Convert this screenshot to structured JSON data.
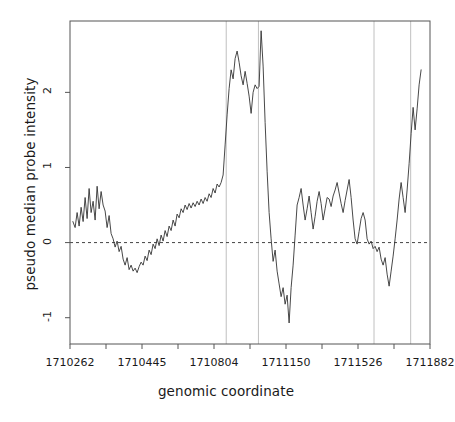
{
  "chart_data": {
    "type": "line",
    "title": "",
    "xlabel": "genomic coordinate",
    "ylabel": "pseudo median probe intensity",
    "grid": false,
    "legend": null,
    "xlim": [
      1710262,
      1711882
    ],
    "ylim": [
      -1.35,
      2.95
    ],
    "xticks": [
      1710262,
      1710445,
      1710804,
      1711150,
      1711526,
      1711882
    ],
    "xtick_labels": [
      "1710262",
      "1710445",
      "1710804",
      "1711150",
      "1711526",
      "1711882"
    ],
    "yticks": [
      -1,
      0,
      1,
      2
    ],
    "ytick_labels": [
      "-1",
      "0",
      "1",
      "2"
    ],
    "zero_line": 0,
    "zero_line_style": "dashed",
    "vertical_markers": [
      1710965,
      1711110,
      1711630,
      1711795
    ],
    "series": [
      {
        "name": "pseudo median probe intensity",
        "color": "#333333",
        "x": [
          1710275,
          1710285,
          1710294,
          1710303,
          1710312,
          1710321,
          1710330,
          1710339,
          1710348,
          1710357,
          1710366,
          1710375,
          1710384,
          1710393,
          1710402,
          1710411,
          1710420,
          1710429,
          1710438,
          1710447,
          1710456,
          1710465,
          1710474,
          1710483,
          1710492,
          1710501,
          1710510,
          1710519,
          1710528,
          1710537,
          1710546,
          1710555,
          1710564,
          1710573,
          1710582,
          1710591,
          1710600,
          1710609,
          1710618,
          1710627,
          1710636,
          1710645,
          1710654,
          1710663,
          1710672,
          1710681,
          1710690,
          1710699,
          1710708,
          1710717,
          1710726,
          1710735,
          1710744,
          1710753,
          1710762,
          1710771,
          1710780,
          1710789,
          1710798,
          1710807,
          1710816,
          1710825,
          1710834,
          1710843,
          1710852,
          1710861,
          1710870,
          1710879,
          1710888,
          1710897,
          1710906,
          1710915,
          1710924,
          1710933,
          1710942,
          1710951,
          1710960,
          1710969,
          1710978,
          1710987,
          1710996,
          1711005,
          1711014,
          1711023,
          1711032,
          1711041,
          1711050,
          1711059,
          1711068,
          1711077,
          1711086,
          1711095,
          1711104,
          1711113,
          1711122,
          1711131,
          1711140,
          1711149,
          1711158,
          1711167,
          1711176,
          1711185,
          1711194,
          1711203,
          1711212,
          1711221,
          1711230,
          1711239,
          1711248,
          1711257,
          1711266,
          1711275,
          1711284,
          1711293,
          1711302,
          1711311,
          1711320,
          1711329,
          1711338,
          1711347,
          1711356,
          1711365,
          1711374,
          1711383,
          1711392,
          1711401,
          1711410,
          1711419,
          1711428,
          1711437,
          1711446,
          1711455,
          1711464,
          1711473,
          1711482,
          1711491,
          1711500,
          1711509,
          1711518,
          1711527,
          1711536,
          1711545,
          1711554,
          1711563,
          1711572,
          1711581,
          1711590,
          1711599,
          1711608,
          1711617,
          1711626,
          1711635,
          1711644,
          1711653,
          1711662,
          1711671,
          1711680,
          1711689,
          1711698,
          1711707,
          1711716,
          1711725,
          1711734,
          1711743,
          1711752,
          1711761,
          1711770,
          1711779,
          1711788,
          1711797,
          1711806,
          1711815,
          1711824,
          1711833,
          1711842
        ],
        "y": [
          0.28,
          0.2,
          0.4,
          0.22,
          0.47,
          0.28,
          0.6,
          0.32,
          0.72,
          0.4,
          0.55,
          0.3,
          0.75,
          0.45,
          0.68,
          0.5,
          0.42,
          0.2,
          0.36,
          0.12,
          0.05,
          -0.06,
          0.02,
          -0.12,
          -0.05,
          -0.22,
          -0.3,
          -0.2,
          -0.36,
          -0.3,
          -0.38,
          -0.34,
          -0.4,
          -0.32,
          -0.26,
          -0.3,
          -0.18,
          -0.24,
          -0.1,
          -0.16,
          -0.02,
          -0.08,
          0.05,
          -0.04,
          0.1,
          0.02,
          0.16,
          0.08,
          0.22,
          0.16,
          0.3,
          0.22,
          0.38,
          0.33,
          0.45,
          0.4,
          0.5,
          0.44,
          0.52,
          0.46,
          0.53,
          0.48,
          0.55,
          0.5,
          0.58,
          0.52,
          0.6,
          0.55,
          0.65,
          0.6,
          0.72,
          0.66,
          0.78,
          0.74,
          0.8,
          0.9,
          1.3,
          1.7,
          2.05,
          2.3,
          2.18,
          2.45,
          2.55,
          2.4,
          2.22,
          2.1,
          2.28,
          2.12,
          1.95,
          1.72,
          2.0,
          2.1,
          2.05,
          2.08,
          2.82,
          2.35,
          1.6,
          0.95,
          0.4,
          0.05,
          -0.25,
          -0.1,
          -0.38,
          -0.55,
          -0.72,
          -0.6,
          -0.82,
          -0.7,
          -1.07,
          -0.6,
          -0.3,
          0.1,
          0.5,
          0.6,
          0.72,
          0.5,
          0.3,
          0.45,
          0.62,
          0.4,
          0.18,
          0.35,
          0.55,
          0.68,
          0.52,
          0.3,
          0.45,
          0.6,
          0.58,
          0.48,
          0.62,
          0.7,
          0.8,
          0.66,
          0.52,
          0.4,
          0.56,
          0.7,
          0.84,
          0.6,
          0.3,
          0.05,
          -0.02,
          0.15,
          0.32,
          0.4,
          0.3,
          0.05,
          -0.02,
          0.02,
          -0.08,
          -0.05,
          -0.12,
          -0.06,
          -0.22,
          -0.3,
          -0.2,
          -0.42,
          -0.58,
          -0.38,
          -0.18,
          0.05,
          0.3,
          0.58,
          0.8,
          0.6,
          0.4,
          0.7,
          1.05,
          1.45,
          1.8,
          1.5,
          1.78,
          2.1,
          2.3
        ]
      }
    ]
  },
  "axes": {
    "x_title": "genomic coordinate",
    "y_title": "pseudo median probe intensity"
  }
}
